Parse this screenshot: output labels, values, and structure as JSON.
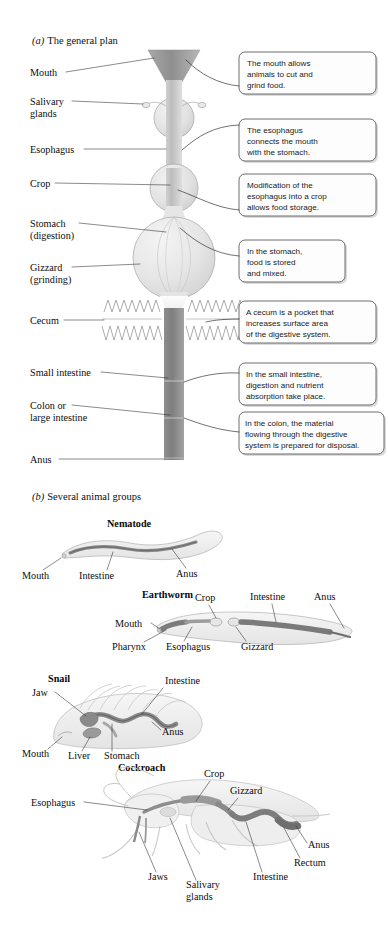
{
  "figure": {
    "background_color": "#ffffff",
    "panel_a": {
      "caption_marker": "(a)",
      "caption_text": "The general plan",
      "labels": [
        {
          "id": "mouth",
          "text": "Mouth"
        },
        {
          "id": "salivary-glands-l1",
          "text": "Salivary"
        },
        {
          "id": "salivary-glands-l2",
          "text": "glands"
        },
        {
          "id": "esophagus",
          "text": "Esophagus"
        },
        {
          "id": "crop",
          "text": "Crop"
        },
        {
          "id": "stomach-l1",
          "text": "Stomach"
        },
        {
          "id": "stomach-l2",
          "text": "(digestion)"
        },
        {
          "id": "gizzard-l1",
          "text": "Gizzard"
        },
        {
          "id": "gizzard-l2",
          "text": "(grinding)"
        },
        {
          "id": "cecum",
          "text": "Cecum"
        },
        {
          "id": "small-intestine",
          "text": "Small intestine"
        },
        {
          "id": "colon-l1",
          "text": "Colon or"
        },
        {
          "id": "colon-l2",
          "text": "large intestine"
        },
        {
          "id": "anus",
          "text": "Anus"
        }
      ],
      "callouts": [
        {
          "id": "callout-mouth",
          "lines": [
            "The mouth allows",
            "animals to cut and",
            "grind food."
          ]
        },
        {
          "id": "callout-esophagus",
          "lines": [
            "The esophagus",
            "connects the mouth",
            "with the stomach."
          ]
        },
        {
          "id": "callout-crop",
          "lines": [
            "Modification of the",
            "esophagus into a crop",
            "allows food storage."
          ]
        },
        {
          "id": "callout-stomach",
          "lines": [
            "In the stomach,",
            "food is stored",
            "and mixed."
          ]
        },
        {
          "id": "callout-cecum",
          "lines": [
            "A cecum is a pocket that",
            "increases surface area",
            "of the digestive system."
          ]
        },
        {
          "id": "callout-small-intestine",
          "lines": [
            "In the small intestine,",
            "digestion and nutrient",
            "absorption take place."
          ]
        },
        {
          "id": "callout-colon",
          "lines": [
            "In the colon, the material",
            "flowing through the digestive",
            "system is prepared for disposal."
          ]
        }
      ]
    },
    "panel_b": {
      "caption_marker": "(b)",
      "caption_text": "Several animal groups",
      "organisms": [
        {
          "id": "nematode",
          "name": "Nematode",
          "labels": [
            {
              "id": "nematode-mouth",
              "text": "Mouth"
            },
            {
              "id": "nematode-intestine",
              "text": "Intestine"
            },
            {
              "id": "nematode-anus",
              "text": "Anus"
            }
          ]
        },
        {
          "id": "earthworm",
          "name": "Earthworm",
          "labels": [
            {
              "id": "earthworm-mouth",
              "text": "Mouth"
            },
            {
              "id": "earthworm-pharynx",
              "text": "Pharynx"
            },
            {
              "id": "earthworm-esophagus",
              "text": "Esophagus"
            },
            {
              "id": "earthworm-crop",
              "text": "Crop"
            },
            {
              "id": "earthworm-gizzard",
              "text": "Gizzard"
            },
            {
              "id": "earthworm-intestine",
              "text": "Intestine"
            },
            {
              "id": "earthworm-anus",
              "text": "Anus"
            }
          ]
        },
        {
          "id": "snail",
          "name": "Snail",
          "labels": [
            {
              "id": "snail-jaw",
              "text": "Jaw"
            },
            {
              "id": "snail-mouth",
              "text": "Mouth"
            },
            {
              "id": "snail-liver",
              "text": "Liver"
            },
            {
              "id": "snail-stomach",
              "text": "Stomach"
            },
            {
              "id": "snail-intestine",
              "text": "Intestine"
            },
            {
              "id": "snail-anus",
              "text": "Anus"
            }
          ]
        },
        {
          "id": "cockroach",
          "name": "Cockroach",
          "labels": [
            {
              "id": "cockroach-esophagus",
              "text": "Esophagus"
            },
            {
              "id": "cockroach-crop",
              "text": "Crop"
            },
            {
              "id": "cockroach-gizzard",
              "text": "Gizzard"
            },
            {
              "id": "cockroach-jaws",
              "text": "Jaws"
            },
            {
              "id": "cockroach-salivary-l1",
              "text": "Salivary"
            },
            {
              "id": "cockroach-salivary-l2",
              "text": "glands"
            },
            {
              "id": "cockroach-intestine",
              "text": "Intestine"
            },
            {
              "id": "cockroach-rectum",
              "text": "Rectum"
            },
            {
              "id": "cockroach-anus",
              "text": "Anus"
            }
          ]
        }
      ]
    },
    "colors": {
      "mouth_funnel": "#9d9d9d",
      "esophagus_tube": "#c9c9c9",
      "organ_fill_light": "#eaeaea",
      "organ_fill_mid": "#d8d8d8",
      "intestine_tube": "#8c8c8c",
      "gut_dark": "#7a7a7a",
      "body_outline": "#b4b4b4",
      "callout_border": "#4a4a4a",
      "callout_fill": "#fdfdfd",
      "text": "#101010"
    }
  }
}
